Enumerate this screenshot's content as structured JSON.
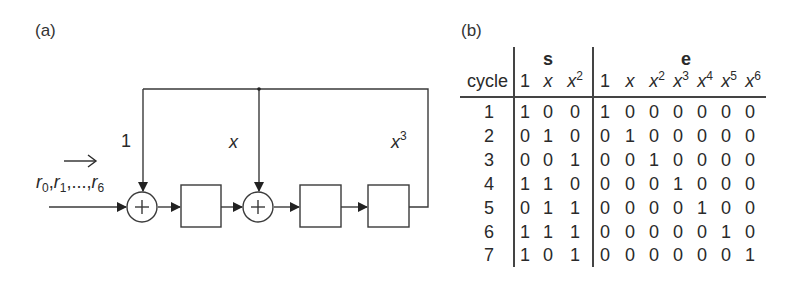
{
  "panel_a": {
    "label": "(a)",
    "input_label": {
      "r0": "r",
      "r0_sub": "0",
      "r1": "r",
      "r1_sub": "1",
      "dots": ",...,",
      "r6": "r",
      "r6_sub": "6",
      "arrow": "→"
    },
    "taps": [
      {
        "name": "tap-1",
        "label": "1",
        "italic": false,
        "sup": ""
      },
      {
        "name": "tap-x",
        "label": "x",
        "italic": true,
        "sup": ""
      },
      {
        "name": "tap-x3",
        "label": "x",
        "italic": true,
        "sup": "3"
      }
    ],
    "components": {
      "adders": 2,
      "registers": 3,
      "adder_symbol": "+"
    }
  },
  "panel_b": {
    "label": "(b)",
    "group_headers": {
      "s": "s",
      "e": "e"
    },
    "row_header": "cycle",
    "columns": {
      "s": [
        {
          "base": "1",
          "sup": ""
        },
        {
          "base": "x",
          "sup": ""
        },
        {
          "base": "x",
          "sup": "2"
        }
      ],
      "e": [
        {
          "base": "1",
          "sup": ""
        },
        {
          "base": "x",
          "sup": ""
        },
        {
          "base": "x",
          "sup": "2"
        },
        {
          "base": "x",
          "sup": "3"
        },
        {
          "base": "x",
          "sup": "4"
        },
        {
          "base": "x",
          "sup": "5"
        },
        {
          "base": "x",
          "sup": "6"
        }
      ]
    },
    "rows": [
      {
        "cycle": "1",
        "s": [
          "1",
          "0",
          "0"
        ],
        "e": [
          "1",
          "0",
          "0",
          "0",
          "0",
          "0",
          "0"
        ]
      },
      {
        "cycle": "2",
        "s": [
          "0",
          "1",
          "0"
        ],
        "e": [
          "0",
          "1",
          "0",
          "0",
          "0",
          "0",
          "0"
        ]
      },
      {
        "cycle": "3",
        "s": [
          "0",
          "0",
          "1"
        ],
        "e": [
          "0",
          "0",
          "1",
          "0",
          "0",
          "0",
          "0"
        ]
      },
      {
        "cycle": "4",
        "s": [
          "1",
          "1",
          "0"
        ],
        "e": [
          "0",
          "0",
          "0",
          "1",
          "0",
          "0",
          "0"
        ]
      },
      {
        "cycle": "5",
        "s": [
          "0",
          "1",
          "1"
        ],
        "e": [
          "0",
          "0",
          "0",
          "0",
          "1",
          "0",
          "0"
        ]
      },
      {
        "cycle": "6",
        "s": [
          "1",
          "1",
          "1"
        ],
        "e": [
          "0",
          "0",
          "0",
          "0",
          "0",
          "1",
          "0"
        ]
      },
      {
        "cycle": "7",
        "s": [
          "1",
          "0",
          "1"
        ],
        "e": [
          "0",
          "0",
          "0",
          "0",
          "0",
          "0",
          "1"
        ]
      }
    ]
  }
}
